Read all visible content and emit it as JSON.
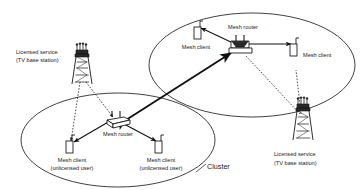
{
  "figure": {
    "type": "network-topology-diagram",
    "background_color": "#ffffff",
    "line_color": "#1a1a1a",
    "style": "scanned black and white line drawing"
  },
  "labels": {
    "cluster": "Cluster",
    "mesh_router_left": "Mesh router",
    "mesh_router_right": "Mesh router",
    "mesh_client_plain_left": "Mesh client",
    "mesh_client_plain_right": "Mesh client",
    "mesh_client_unlicensed_1_line1": "Mesh client",
    "mesh_client_unlicensed_1_line2": "(unlicensed user)",
    "mesh_client_unlicensed_2_line1": "Mesh client",
    "mesh_client_unlicensed_2_line2": "(unlicensed user)",
    "licensed_service_left_line1": "Licensed service",
    "licensed_service_left_line2": "(TV base station)",
    "licensed_service_right_line1": "Licensed service",
    "licensed_service_right_line2": "(TV base station)"
  },
  "nodes": [
    {
      "id": "tower-left",
      "icon": "tv-tower-icon",
      "role": "licensed TV base station",
      "x": 82,
      "y": 70
    },
    {
      "id": "tower-right",
      "icon": "tv-tower-icon",
      "role": "licensed TV base station",
      "x": 303,
      "y": 120
    },
    {
      "id": "router-left",
      "icon": "mesh-router-icon",
      "role": "mesh router",
      "x": 116,
      "y": 124
    },
    {
      "id": "router-right",
      "icon": "mesh-router-icon",
      "role": "mesh router",
      "x": 240,
      "y": 47
    },
    {
      "id": "client-left-1",
      "icon": "mesh-client-icon",
      "role": "unlicensed mesh client",
      "x": 69,
      "y": 150
    },
    {
      "id": "client-left-2",
      "icon": "mesh-client-icon",
      "role": "unlicensed mesh client",
      "x": 158,
      "y": 150
    },
    {
      "id": "client-right-1",
      "icon": "mesh-client-icon",
      "role": "mesh client",
      "x": 196,
      "y": 32
    },
    {
      "id": "client-right-2",
      "icon": "mesh-client-icon",
      "role": "mesh client",
      "x": 295,
      "y": 60
    }
  ],
  "clusters": [
    {
      "id": "cluster-left",
      "shape": "ellipse",
      "cx": 118,
      "cy": 140,
      "rx": 97,
      "ry": 47
    },
    {
      "id": "cluster-right",
      "shape": "ellipse",
      "cx": 252,
      "cy": 65,
      "rx": 103,
      "ry": 52
    }
  ],
  "links": [
    {
      "from": "router-left",
      "to": "router-right",
      "style": "solid",
      "arrows": "both",
      "meaning": "inter-router mesh backbone"
    },
    {
      "from": "router-left",
      "to": "client-left-1",
      "style": "solid",
      "arrows": "end"
    },
    {
      "from": "router-left",
      "to": "client-left-2",
      "style": "solid",
      "arrows": "end"
    },
    {
      "from": "router-right",
      "to": "client-right-1",
      "style": "solid",
      "arrows": "end"
    },
    {
      "from": "router-right",
      "to": "client-right-2",
      "style": "solid",
      "arrows": "both"
    },
    {
      "from": "tower-left",
      "to": "router-left",
      "style": "dotted",
      "arrows": "end",
      "meaning": "licensed TV signal"
    },
    {
      "from": "tower-left",
      "to": "client-left-1",
      "style": "dotted",
      "arrows": "end",
      "meaning": "licensed TV signal"
    },
    {
      "from": "tower-right",
      "to": "router-right",
      "style": "dotted",
      "arrows": "none",
      "meaning": "licensed TV signal"
    },
    {
      "from": "tower-right",
      "to": "client-right-2",
      "style": "dotted",
      "arrows": "none",
      "meaning": "licensed TV signal"
    }
  ],
  "icons": {
    "tv_tower": "tv-tower-icon",
    "mesh_router": "mesh-router-icon",
    "mesh_client": "mesh-client-icon"
  }
}
